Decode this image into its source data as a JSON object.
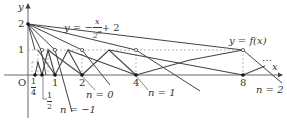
{
  "diagram": {
    "type": "function-graph",
    "colors": {
      "axis": "#555555",
      "curve": "#444444",
      "dashed": "#999999",
      "text": "#333333"
    },
    "axes": {
      "x_label": "x",
      "y_label": "y",
      "origin_label": "O",
      "y_ticks": [
        {
          "value": 1,
          "label": "1"
        },
        {
          "value": 2,
          "label": "2"
        }
      ],
      "x_ticks": [
        {
          "value": 0.25,
          "label_num": "1",
          "label_den": "4"
        },
        {
          "value": 0.5,
          "label_num": "1",
          "label_den": "2"
        },
        {
          "value": 1,
          "label": "1"
        },
        {
          "value": 2,
          "label": "2"
        },
        {
          "value": 4,
          "label": "4"
        },
        {
          "value": 8,
          "label": "8"
        }
      ]
    },
    "line_label": {
      "prefix": "y = −",
      "num": "x",
      "den": "2",
      "den_exp": "n",
      "suffix": "+ 2"
    },
    "curve_label": "y = f(x)",
    "ellipsis": "…",
    "n_labels": [
      "n = −1",
      "n = 0",
      "n = 1",
      "n = 2"
    ],
    "apex_points": [
      {
        "x": 0.25,
        "y": 0
      },
      {
        "x": 0.5,
        "y": 0
      },
      {
        "x": 1,
        "y": 0
      },
      {
        "x": 2,
        "y": 0
      },
      {
        "x": 4,
        "y": 0
      },
      {
        "x": 8,
        "y": 0
      }
    ],
    "open_points_y1": [
      0.375,
      0.75,
      1.5,
      3,
      6
    ]
  }
}
